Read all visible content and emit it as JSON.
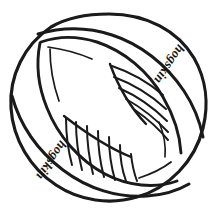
{
  "artwork": {
    "title": "hogskin ball line drawing",
    "description": "Black ink line-art of a round ball with a diagonal seam band, a central lens-shaped panel and two hatched shaded sections",
    "background_color": "#ffffff",
    "ink_color": "#1a1a1a",
    "canvas": {
      "width": 216,
      "height": 216
    }
  },
  "labels": {
    "upper_right": {
      "text": "hogskin",
      "rotation_degrees": 180,
      "orientation": "upside-down along diagonal band",
      "x": 166,
      "y": 62,
      "font_size": 13,
      "baseline_angle": -56
    },
    "lower_left": {
      "text": "hogskin",
      "rotation_degrees": 180,
      "orientation": "upside-down along diagonal band",
      "x": 48,
      "y": 158,
      "font_size": 13,
      "baseline_angle": -56
    }
  },
  "shapes": {
    "outer_circle": {
      "name": "ball-outline",
      "cx": 108,
      "cy": 107,
      "rx": 97,
      "ry": 93,
      "stroke_width": 3.2
    },
    "band": {
      "name": "diagonal-seam-band",
      "angle_degrees": -38,
      "stroke_width": 3.0
    },
    "center_lens": {
      "name": "center-panel",
      "stroke_width": 2.8
    }
  },
  "hatching": {
    "upper_right": {
      "name": "upper-right-hatch",
      "line_count": 5,
      "direction": "diagonal down-right",
      "stroke_width": 2.0
    },
    "lower_left": {
      "name": "lower-left-hatch",
      "line_count": 7,
      "direction": "near-vertical",
      "stroke_width": 2.0
    }
  }
}
